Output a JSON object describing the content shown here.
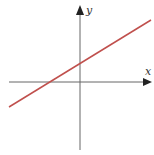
{
  "diagram": {
    "type": "coordinate-plane-line",
    "axes": {
      "x_label": "x",
      "y_label": "y",
      "axis_color": "#555555"
    },
    "line": {
      "color": "#c0504d",
      "description": "increasing straight line with positive slope, negative x-intercept, positive y-intercept"
    }
  }
}
